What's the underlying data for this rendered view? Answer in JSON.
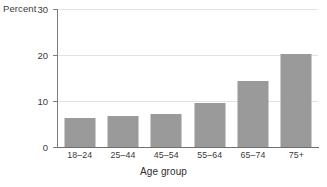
{
  "chart_data": {
    "type": "bar",
    "title": "",
    "subtitle": "",
    "categories": [
      "18–24",
      "25–44",
      "45–54",
      "55–64",
      "65–74",
      "75+"
    ],
    "values": [
      6.3,
      6.7,
      7.2,
      9.6,
      14.3,
      20.3
    ],
    "series": [
      {
        "name": "Percent",
        "values": [
          6.3,
          6.7,
          7.2,
          9.6,
          14.3,
          20.3
        ]
      }
    ],
    "xlabel": "Age group",
    "ylabel": "Percent",
    "ylim": [
      0,
      30
    ],
    "yticks": [
      0,
      10,
      20,
      30
    ],
    "ytick_labels": [
      "0",
      "10",
      "20",
      "30"
    ],
    "grid": true,
    "grid_axis": "y",
    "legend": false,
    "legend_position": "none",
    "annotations": [],
    "colors": {
      "bar": "#9a9a9a",
      "gridline": "#e2e2e2",
      "axis": "#7d7d7d",
      "text": "#3a3a3a",
      "background": "#ffffff"
    }
  },
  "axes": {
    "y_title": "Percent",
    "x_title": "Age group"
  }
}
